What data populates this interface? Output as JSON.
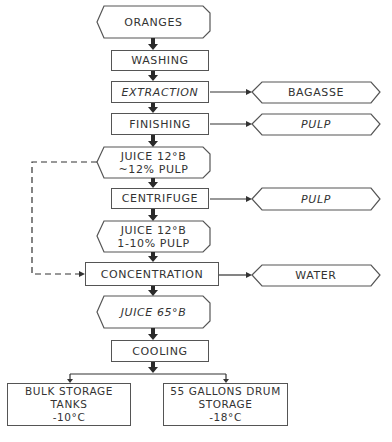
{
  "diagram": {
    "main_flow": [
      {
        "id": "oranges",
        "label": "ORANGES",
        "shape": "hexagon"
      },
      {
        "id": "washing",
        "label": "WASHING",
        "shape": "rect"
      },
      {
        "id": "extraction",
        "label": "EXTRACTION",
        "shape": "rect"
      },
      {
        "id": "finishing",
        "label": "FINISHING",
        "shape": "rect"
      },
      {
        "id": "juice1",
        "label": "JUICE 12°B\n~12% PULP",
        "shape": "hexagon"
      },
      {
        "id": "centrifuge",
        "label": "CENTRIFUGE",
        "shape": "rect"
      },
      {
        "id": "juice2",
        "label": "JUICE 12°B\n1-10% PULP",
        "shape": "hexagon"
      },
      {
        "id": "concentration",
        "label": "CONCENTRATION",
        "shape": "rect"
      },
      {
        "id": "juice3",
        "label": "JUICE 65°B",
        "shape": "hexagon"
      },
      {
        "id": "cooling",
        "label": "COOLING",
        "shape": "rect"
      }
    ],
    "side_outputs": [
      {
        "from": "extraction",
        "label": "BAGASSE"
      },
      {
        "from": "finishing",
        "label": "PULP"
      },
      {
        "from": "centrifuge",
        "label": "PULP"
      },
      {
        "from": "concentration",
        "label": "WATER"
      }
    ],
    "storage": [
      {
        "label": "BULK STORAGE\nTANKS\n-10°C"
      },
      {
        "label": "55 GALLONS DRUM\nSTORAGE\n-18°C"
      }
    ],
    "bypass": {
      "from": "juice1",
      "to": "concentration",
      "style": "dashed"
    }
  },
  "colors": {
    "line": "#555555",
    "arrow": "#2a2a2a",
    "text": "#333333"
  }
}
